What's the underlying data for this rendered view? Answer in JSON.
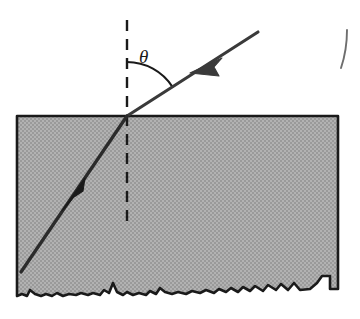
{
  "figure": {
    "labels": {
      "angle_symbol": "θ"
    },
    "colors": {
      "medium_fill": "#a9a9a9",
      "medium_stroke": "#1a1a1a",
      "ray_stroke": "#3a3a3a",
      "normal_stroke": "#1a1a1a",
      "arc_stroke": "#1a1a1a",
      "background": "#ffffff",
      "text": "#1a1a1a"
    },
    "geometry": {
      "interface_point": {
        "x": 127,
        "y": 116
      },
      "medium_rect": {
        "x": 17,
        "y": 116,
        "width": 321,
        "height": 180
      },
      "incident_ray": {
        "x1": 258,
        "y1": 32,
        "x2": 127,
        "y2": 116
      },
      "refracted_ray": {
        "x1": 127,
        "y1": 116,
        "x2": 21,
        "y2": 272
      },
      "normal_line": {
        "x": 127,
        "y_top": 20,
        "y_bottom": 228
      },
      "angle_arc": {
        "center_x": 127,
        "center_y": 116,
        "radius": 54
      },
      "incident_arrow": {
        "x": 202,
        "y": 66
      },
      "refracted_arrow": {
        "x": 72,
        "y": 196
      },
      "stray_mark": {
        "x": 345,
        "y": 30
      }
    },
    "angle_label_position": {
      "left": 139,
      "top": 47
    },
    "notes": {
      "normal_style": "dashed",
      "medium_edge_bottom": "jagged rough surface",
      "incident_arrow_direction": "toward interface, down-left",
      "refracted_arrow_direction": "away from interface, down-left"
    }
  }
}
